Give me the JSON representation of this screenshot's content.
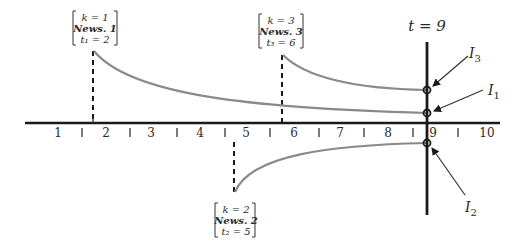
{
  "diagram": {
    "time_marker": {
      "label": "t = 9",
      "t": 9
    },
    "axis": {
      "ticks": [
        "1",
        "2",
        "3",
        "4",
        "5",
        "6",
        "7",
        "8",
        "9",
        "10"
      ]
    },
    "news_events": [
      {
        "k_label": "k = 1",
        "news_label": "News. 1",
        "t_label": "t₁ = 2",
        "k": 1,
        "t": 2,
        "direction": "positive"
      },
      {
        "k_label": "k = 2",
        "news_label": "News. 2",
        "t_label": "t₂ = 5",
        "k": 2,
        "t": 5,
        "direction": "negative"
      },
      {
        "k_label": "k = 3",
        "news_label": "News. 3",
        "t_label": "t₃ = 6",
        "k": 3,
        "t": 6,
        "direction": "positive"
      }
    ],
    "impact_labels": [
      {
        "id": "I3",
        "base": "I",
        "sub": "3"
      },
      {
        "id": "I1",
        "base": "I",
        "sub": "1"
      },
      {
        "id": "I2",
        "base": "I",
        "sub": "2"
      }
    ],
    "colors": {
      "axis": "#1a1a1a",
      "curve": "#8a8a8a",
      "text": "#2a2a2a"
    }
  }
}
